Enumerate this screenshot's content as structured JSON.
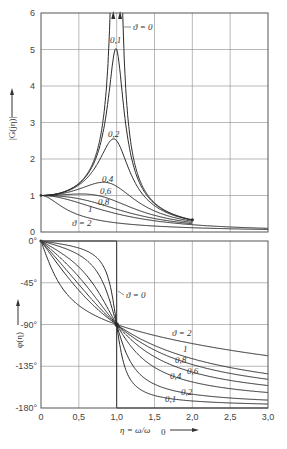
{
  "chart_data": [
    {
      "type": "line",
      "title": "",
      "xlabel": "η = ω/ω0",
      "ylabel": "|G(jη)|",
      "xlim": [
        0,
        3.0
      ],
      "ylim": [
        0,
        6
      ],
      "grid": true,
      "x_ticks": [
        "0",
        "0,5",
        "1,0",
        "1,5",
        "2,0",
        "2,5",
        "3,0"
      ],
      "y_ticks": [
        "0",
        "1",
        "2",
        "3",
        "4",
        "5",
        "6"
      ],
      "formula": "|G(jη)| = 1 / sqrt((1-η²)² + (2ϑη)²)",
      "series": [
        {
          "name": "ϑ = 0",
          "damping": 0,
          "peak_at_eta_1": "∞"
        },
        {
          "name": "0,1",
          "damping": 0.1,
          "peak": 5.0
        },
        {
          "name": "0,2",
          "damping": 0.2,
          "peak": 2.55
        },
        {
          "name": "0,4",
          "damping": 0.4,
          "peak": 1.36
        },
        {
          "name": "0,6",
          "damping": 0.6,
          "peak": 1.04
        },
        {
          "name": "0,8",
          "damping": 0.8,
          "peak": 1.0
        },
        {
          "name": "1",
          "damping": 1,
          "peak": 1.0
        },
        {
          "name": "ϑ = 2",
          "damping": 2,
          "peak": 1.0
        }
      ],
      "x_range_plotted": [
        0,
        2.0
      ],
      "annotations": [
        "ϑ = 0",
        "0,1",
        "0,2",
        "0,4",
        "0,6",
        "0,8",
        "1",
        "ϑ = 2"
      ]
    },
    {
      "type": "line",
      "title": "",
      "xlabel": "η = ω/ω0",
      "ylabel": "φ(η)",
      "xlim": [
        0,
        3.0
      ],
      "ylim": [
        -180,
        0
      ],
      "grid": true,
      "x_ticks": [
        "0",
        "0,5",
        "1,0",
        "1,5",
        "2,0",
        "2,5",
        "3,0"
      ],
      "y_ticks": [
        "0°",
        "-45°",
        "-90°",
        "-135°",
        "-180°"
      ],
      "formula": "φ(η) = -atan2(2ϑη, 1-η²)",
      "series": [
        {
          "name": "ϑ = 0",
          "damping": 0,
          "values": {
            "eta<1": 0,
            "eta>1": -180
          }
        },
        {
          "name": "0,1",
          "damping": 0.1
        },
        {
          "name": "0,2",
          "damping": 0.2
        },
        {
          "name": "0,4",
          "damping": 0.4
        },
        {
          "name": "0,6",
          "damping": 0.6
        },
        {
          "name": "0,8",
          "damping": 0.8
        },
        {
          "name": "1",
          "damping": 1
        },
        {
          "name": "ϑ = 2",
          "damping": 2
        }
      ],
      "phase_at_eta_1": -90,
      "annotations": [
        "ϑ = 0",
        "ϑ = 2",
        "1",
        "0,8",
        "0,6",
        "0,4",
        "0,2",
        "0,1"
      ]
    }
  ],
  "labels": {
    "mag_ylabel": "|G(jη)|",
    "phase_ylabel": "φ(η)",
    "xlabel": "η = ω/ω",
    "xlabel_sub": "0",
    "mag_y_ticks": [
      "0",
      "1",
      "2",
      "3",
      "4",
      "5",
      "6"
    ],
    "phase_y_ticks": [
      "0°",
      "-45°",
      "-90°",
      "-135°",
      "-180°"
    ],
    "x_ticks": [
      "0",
      "0,5",
      "1,0",
      "1,5",
      "2,0",
      "2,5",
      "3,0"
    ],
    "mag_curve_labels": [
      "ϑ = 0",
      "0,1",
      "0,2",
      "0,4",
      "0,6",
      "0,8",
      "1",
      "ϑ = 2"
    ],
    "phase_curve_labels": [
      "ϑ = 0",
      "ϑ = 2",
      "1",
      "0,8",
      "0,6",
      "0,4",
      "0,2",
      "0,1"
    ]
  },
  "dampings": [
    0,
    0.1,
    0.2,
    0.4,
    0.6,
    0.8,
    1,
    2
  ],
  "colors": {
    "line": "#2b2b2b",
    "grid": "#8a8a8a",
    "axis": "#555555",
    "text": "#333333"
  }
}
